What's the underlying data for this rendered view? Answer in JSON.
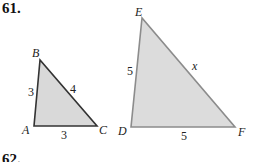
{
  "problem": {
    "number": "61.",
    "next_number": "62."
  },
  "colors": {
    "fill": "#d9d9d9",
    "small_stroke": "#333333",
    "large_stroke": "#8c8c8c"
  },
  "triangle_small": {
    "vertices": {
      "A": "A",
      "B": "B",
      "C": "C"
    },
    "sides": {
      "AB": "3",
      "BC": "4",
      "AC": "3"
    }
  },
  "triangle_large": {
    "vertices": {
      "D": "D",
      "E": "E",
      "F": "F"
    },
    "sides": {
      "DE": "5",
      "EF": "x",
      "DF": "5"
    }
  }
}
